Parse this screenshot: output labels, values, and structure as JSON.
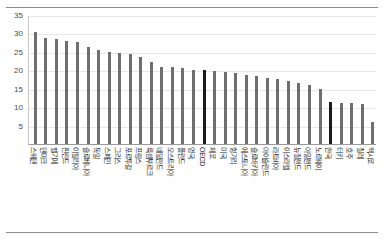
{
  "chart_data": {
    "type": "bar",
    "title": "",
    "xlabel": "",
    "ylabel": "",
    "ylim": [
      0,
      35
    ],
    "ytick_labels": [
      "0",
      "5",
      "10",
      "15",
      "20",
      "25",
      "30",
      "35"
    ],
    "yticks": [
      0,
      5,
      10,
      15,
      20,
      25,
      30,
      35
    ],
    "grid": true,
    "legend": "none",
    "bar_color": "#6e6e6e",
    "highlight_color": "#1a1a1a",
    "highlighted_categories": [
      "OECD",
      "한국"
    ],
    "categories": [
      "스웨덴",
      "덴마크",
      "벨기에",
      "핀란드",
      "이탈리아",
      "슬로베니아",
      "독일",
      "스페인",
      "그리스",
      "포르투갈",
      "프랑스",
      "룩셈부르크",
      "네덜란드",
      "오스트리아",
      "폴란드",
      "영국",
      "OECD",
      "체코",
      "미국",
      "헝가리",
      "에스토니아",
      "슬로바키아",
      "아이슬란드",
      "라트비아",
      "이스라엘",
      "뉴질랜드",
      "아일랜드",
      "노르웨이",
      "한국",
      "터키",
      "호주",
      "칠레",
      "멕시코"
    ],
    "values": [
      30.5,
      28.7,
      28.6,
      27.9,
      27.7,
      26.4,
      25.4,
      25.0,
      24.8,
      24.3,
      23.5,
      22.2,
      21.0,
      20.8,
      20.6,
      20.2,
      20.0,
      19.8,
      19.5,
      19.2,
      18.8,
      18.4,
      18.0,
      17.6,
      17.2,
      16.6,
      16.0,
      14.8,
      11.5,
      11.2,
      11.0,
      10.9,
      6.0
    ]
  }
}
